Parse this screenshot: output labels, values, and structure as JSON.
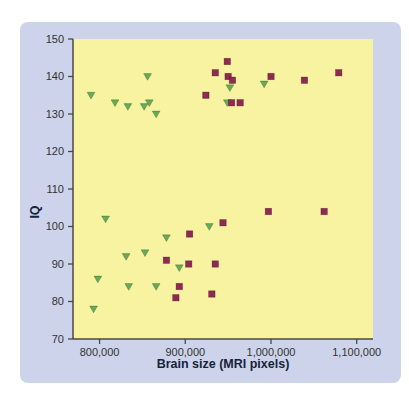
{
  "figure": {
    "panel_bg": "#ccd3ea",
    "plot_bg": "#f7f3a1",
    "axis_color": "#4a4a45",
    "tick_label_color": "#333330",
    "title_color": "#16233c"
  },
  "chart_data": {
    "type": "scatter",
    "title": "",
    "xlabel": "Brain size (MRI pixels)",
    "ylabel": "IQ",
    "xlim": [
      769000,
      1119000
    ],
    "ylim": [
      70,
      150
    ],
    "grid": false,
    "legend": "none",
    "x_ticks": [
      {
        "value": 800000,
        "label": "800,000"
      },
      {
        "value": 900000,
        "label": "900,000"
      },
      {
        "value": 1000000,
        "label": "1,000,000"
      },
      {
        "value": 1100000,
        "label": "1,100,000"
      }
    ],
    "y_ticks": [
      {
        "value": 70,
        "label": "70"
      },
      {
        "value": 80,
        "label": "80"
      },
      {
        "value": 90,
        "label": "90"
      },
      {
        "value": 100,
        "label": "100"
      },
      {
        "value": 110,
        "label": "110"
      },
      {
        "value": 120,
        "label": "120"
      },
      {
        "value": 130,
        "label": "130"
      },
      {
        "value": 140,
        "label": "140"
      },
      {
        "value": 150,
        "label": "150"
      }
    ],
    "series": [
      {
        "name": "green-triangles",
        "marker": "triangle-down",
        "color": "#6aa957",
        "points": [
          [
            790000,
            135
          ],
          [
            818000,
            133
          ],
          [
            833000,
            132
          ],
          [
            852000,
            132
          ],
          [
            856000,
            140
          ],
          [
            858000,
            133
          ],
          [
            866000,
            130
          ],
          [
            949000,
            133
          ],
          [
            952000,
            137
          ],
          [
            992000,
            138
          ],
          [
            793000,
            78
          ],
          [
            798000,
            86
          ],
          [
            807000,
            102
          ],
          [
            831000,
            92
          ],
          [
            834000,
            84
          ],
          [
            853000,
            93
          ],
          [
            866000,
            84
          ],
          [
            878000,
            97
          ],
          [
            893000,
            89
          ],
          [
            928000,
            100
          ]
        ]
      },
      {
        "name": "magenta-squares",
        "marker": "square",
        "color": "#8e2a53",
        "points": [
          [
            924000,
            135
          ],
          [
            935000,
            141
          ],
          [
            949000,
            144
          ],
          [
            950000,
            140
          ],
          [
            954000,
            133
          ],
          [
            955000,
            139
          ],
          [
            964000,
            133
          ],
          [
            1000000,
            140
          ],
          [
            1039000,
            139
          ],
          [
            1079000,
            141
          ],
          [
            878000,
            91
          ],
          [
            889000,
            81
          ],
          [
            893000,
            84
          ],
          [
            904000,
            90
          ],
          [
            905000,
            98
          ],
          [
            931000,
            82
          ],
          [
            935000,
            90
          ],
          [
            944000,
            101
          ],
          [
            997000,
            104
          ],
          [
            1062000,
            104
          ]
        ]
      }
    ]
  }
}
